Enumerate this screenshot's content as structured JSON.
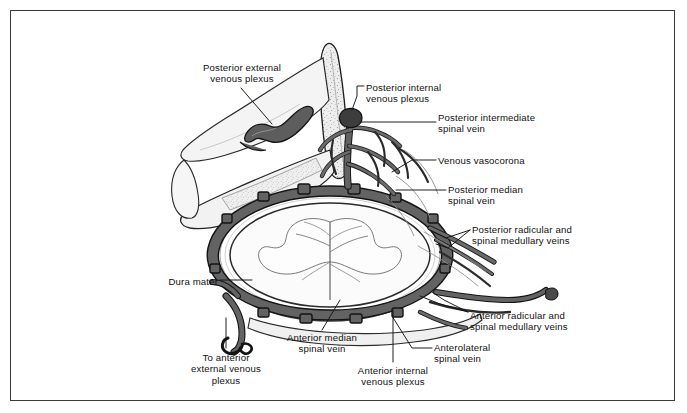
{
  "figure": {
    "border_color": "#3a3a3a",
    "background": "#ffffff",
    "ink_color": "#111111",
    "vein_fill": "#6a6a6a",
    "vein_fill_dark": "#4a4a4a",
    "bone_fill": "#e9e9e9",
    "cord_fill": "#fbfbfb"
  },
  "labels": [
    {
      "id": "posterior-external-venous-plexus",
      "lines": [
        "Posterior external",
        "venous plexus"
      ],
      "align": "center",
      "x": 186,
      "y": 62,
      "w": 112
    },
    {
      "id": "posterior-internal-venous-plexus",
      "lines": [
        "Posterior internal",
        "venous plexus"
      ],
      "align": "left",
      "x": 366,
      "y": 82,
      "w": 115
    },
    {
      "id": "posterior-intermediate-spinal-vein",
      "lines": [
        "Posterior intermediate",
        "spinal vein"
      ],
      "align": "left",
      "x": 438,
      "y": 112,
      "w": 140
    },
    {
      "id": "venous-vasocorona",
      "lines": [
        "Venous vasocorona"
      ],
      "align": "left",
      "x": 438,
      "y": 155,
      "w": 125
    },
    {
      "id": "posterior-median-spinal-vein",
      "lines": [
        "Posterior median",
        "spinal vein"
      ],
      "align": "left",
      "x": 448,
      "y": 184,
      "w": 110
    },
    {
      "id": "posterior-radicular-and-spinal-medullary-veins",
      "lines": [
        "Posterior radicular and",
        "spinal medullary veins"
      ],
      "align": "left",
      "x": 472,
      "y": 224,
      "w": 148
    },
    {
      "id": "anterior-radicular-and-spinal-medullary-veins",
      "lines": [
        "Anterior radicular and",
        "spinal medullary veins"
      ],
      "align": "left",
      "x": 470,
      "y": 310,
      "w": 148
    },
    {
      "id": "anterolateral-spinal-vein",
      "lines": [
        "Anterolateral",
        "spinal vein"
      ],
      "align": "left",
      "x": 434,
      "y": 342,
      "w": 90
    },
    {
      "id": "anterior-internal-venous-plexus",
      "lines": [
        "Anterior internal",
        "venous plexus"
      ],
      "align": "center",
      "x": 340,
      "y": 365,
      "w": 106
    },
    {
      "id": "anterior-median-spinal-vein",
      "lines": [
        "Anterior median",
        "spinal vein"
      ],
      "align": "center",
      "x": 272,
      "y": 332,
      "w": 100
    },
    {
      "id": "dura-mater",
      "lines": [
        "Dura mater"
      ],
      "align": "right",
      "x": 156,
      "y": 276,
      "w": 62
    },
    {
      "id": "to-anterior-external-venous-plexus",
      "lines": [
        "To anterior",
        "external venous",
        "plexus"
      ],
      "align": "center",
      "x": 178,
      "y": 352,
      "w": 96
    }
  ],
  "structures": [
    {
      "id": "spinous-process",
      "name": "spinous process"
    },
    {
      "id": "lamina",
      "name": "vertebral lamina"
    },
    {
      "id": "vertebral-body",
      "name": "vertebral body"
    },
    {
      "id": "spinal-cord",
      "name": "spinal cord cross-section"
    },
    {
      "id": "gray-matter",
      "name": "butterfly gray matter"
    },
    {
      "id": "dura-sac",
      "name": "dural sac"
    },
    {
      "id": "epidural-venous-network",
      "name": "epidural venous network"
    }
  ]
}
